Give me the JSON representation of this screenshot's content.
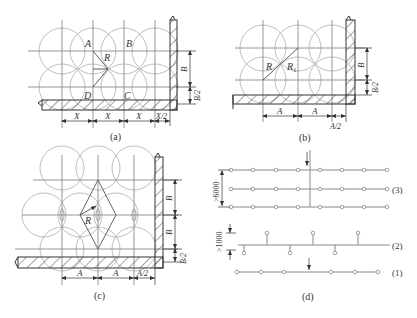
{
  "figure": {
    "panels": [
      {
        "id": "a",
        "caption": "(a)",
        "labels": {
          "A": "A",
          "B": "B",
          "C": "C",
          "D": "D",
          "R": "R"
        },
        "dims_horizontal": [
          "X",
          "X",
          "X",
          "X/2"
        ],
        "dims_vertical": [
          "B",
          "B/2"
        ]
      },
      {
        "id": "b",
        "caption": "(b)",
        "labels": {
          "R": "R",
          "R1": "R",
          "R1_sub": "1"
        },
        "dims_horizontal": [
          "A",
          "A",
          "A/2"
        ],
        "dims_vertical": [
          "B",
          "B/2"
        ]
      },
      {
        "id": "c",
        "caption": "(c)",
        "labels": {
          "R": "R"
        },
        "dims_horizontal": [
          "A",
          "A",
          "A/2"
        ],
        "dims_vertical": [
          "B",
          "B",
          "B/2"
        ]
      },
      {
        "id": "d",
        "caption": "(d)",
        "row_labels": [
          "(3)",
          "(2)",
          "(1)"
        ],
        "dims_vertical": [
          ">6000",
          ">1000"
        ]
      }
    ]
  }
}
